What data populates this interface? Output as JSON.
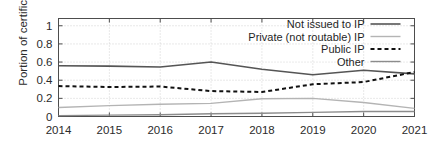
{
  "chart_data": {
    "type": "line",
    "title": "",
    "xlabel": "",
    "ylabel": "Portion of certificates",
    "x": [
      2014,
      2015,
      2016,
      2017,
      2018,
      2019,
      2020,
      2021
    ],
    "categories": [
      "2014",
      "2015",
      "2016",
      "2017",
      "2018",
      "2019",
      "2020",
      "2021"
    ],
    "xlim": [
      2014,
      2021
    ],
    "ylim": [
      0,
      1.08
    ],
    "yticks": [
      0,
      0.2,
      0.4,
      0.6,
      0.8,
      1
    ],
    "ytick_labels": [
      "0",
      "0.2",
      "0.4",
      "0.6",
      "0.8",
      "1"
    ],
    "xtick_labels": [
      "2014",
      "2015",
      "2016",
      "2017",
      "2018",
      "2019",
      "2020",
      "2021"
    ],
    "grid": true,
    "grid_style": "dotted",
    "legend_position": "top-right",
    "legend_boxed": true,
    "series": [
      {
        "name": "Not issued to IP",
        "color": "#555555",
        "style": "solid",
        "width": 1.6,
        "values": [
          0.56,
          0.555,
          0.545,
          0.6,
          0.52,
          0.46,
          0.51,
          0.47
        ]
      },
      {
        "name": "Private (not routable) IP",
        "color": "#b4b4b4",
        "style": "solid",
        "width": 1.4,
        "values": [
          0.1,
          0.12,
          0.135,
          0.145,
          0.195,
          0.2,
          0.155,
          0.09
        ]
      },
      {
        "name": "Public IP",
        "color": "#111111",
        "style": "dashed",
        "width": 2.0,
        "values": [
          0.335,
          0.325,
          0.33,
          0.28,
          0.27,
          0.355,
          0.38,
          0.49
        ]
      },
      {
        "name": "Other",
        "color": "#8c8c8c",
        "style": "solid",
        "width": 1.4,
        "values": [
          0.01,
          0.015,
          0.02,
          0.03,
          0.035,
          0.045,
          0.055,
          0.055
        ]
      }
    ]
  },
  "axes": {
    "frame_color": "#4d4d4d",
    "grid_color": "#c8c8c8",
    "tick_color": "#4d4d4d"
  }
}
